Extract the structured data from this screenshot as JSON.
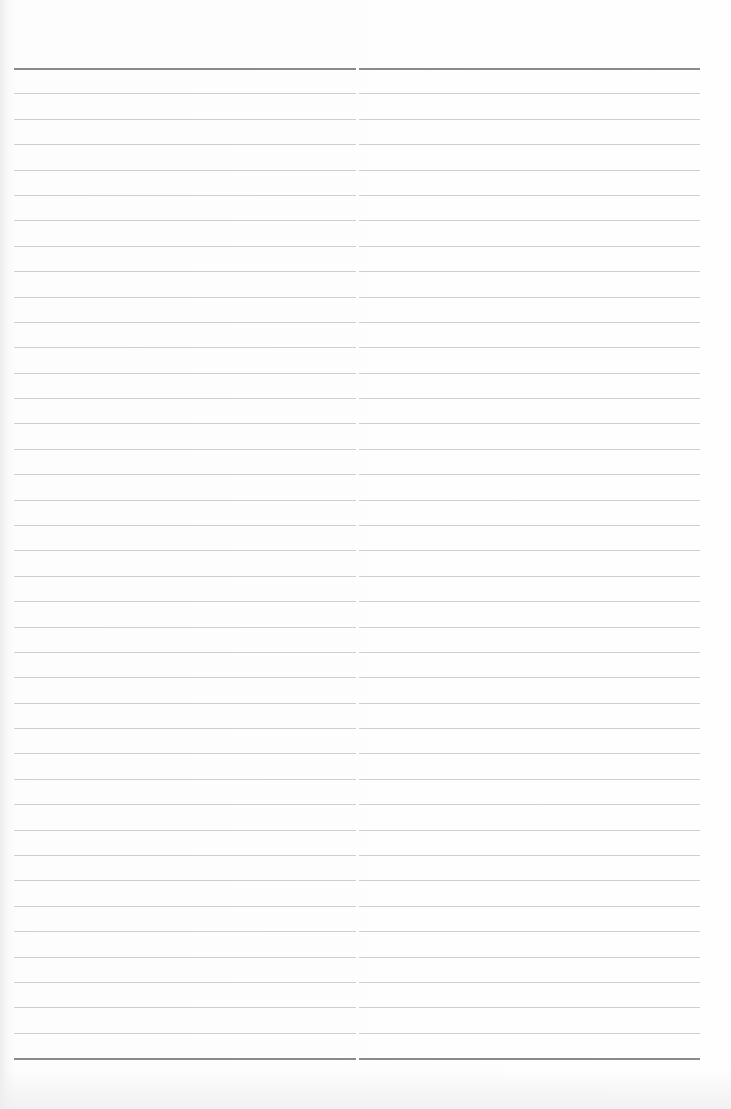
{
  "page": {
    "type": "lined-notebook-page",
    "background_color": "#fdfdfd",
    "columns": 2,
    "line_count": 40,
    "first_line_y": 68,
    "last_line_y": 1058,
    "line_color": "#cfcfcf",
    "heavy_line_color": "#8a8a8a",
    "heavy_lines": [
      "first",
      "last"
    ]
  }
}
